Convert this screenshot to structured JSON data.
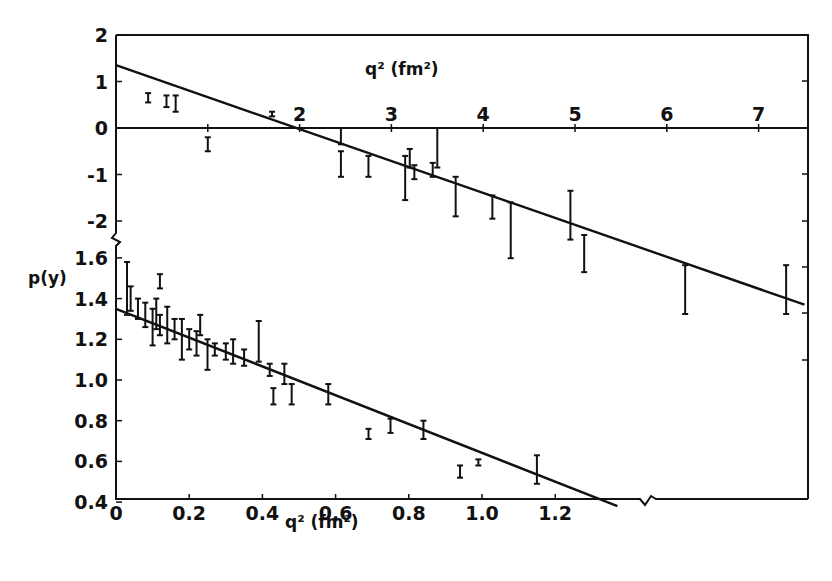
{
  "chart_data": [
    {
      "panel": "upper",
      "type": "scatter",
      "title": "",
      "xlabel": "q² (fm²)",
      "xlabel_position": "top-inside",
      "ylabel": "",
      "xlim": [
        0,
        7.55
      ],
      "ylim": [
        -2.5,
        2
      ],
      "x_ticks": [
        "1",
        "2",
        "3",
        "4",
        "5",
        "6",
        "7"
      ],
      "x_tick_values": [
        1,
        2,
        3,
        4,
        5,
        6,
        7
      ],
      "y_ticks": [
        "2",
        "1",
        "0",
        "-1",
        "-2"
      ],
      "y_tick_values": [
        2,
        1,
        0,
        -1,
        -2
      ],
      "zero_line": true,
      "grid": false,
      "fit_line": {
        "x": [
          0,
          7.5
        ],
        "y": [
          1.35,
          -3.8
        ]
      },
      "points": [
        {
          "x": 0.35,
          "lo": 0.55,
          "hi": 0.75
        },
        {
          "x": 0.55,
          "lo": 0.45,
          "hi": 0.7
        },
        {
          "x": 0.65,
          "lo": 0.35,
          "hi": 0.7
        },
        {
          "x": 1.0,
          "lo": -0.5,
          "hi": -0.2
        },
        {
          "x": 1.7,
          "lo": 0.25,
          "hi": 0.35
        },
        {
          "x": 2.45,
          "lo": -0.35,
          "hi": 0.0
        },
        {
          "x": 2.45,
          "lo": -1.05,
          "hi": -0.5
        },
        {
          "x": 2.75,
          "lo": -1.05,
          "hi": -0.6
        },
        {
          "x": 3.15,
          "lo": -1.55,
          "hi": -0.6
        },
        {
          "x": 3.2,
          "lo": -0.85,
          "hi": -0.45
        },
        {
          "x": 3.25,
          "lo": -1.1,
          "hi": -0.8
        },
        {
          "x": 3.45,
          "lo": -1.05,
          "hi": -0.75
        },
        {
          "x": 3.5,
          "lo": -0.85,
          "hi": 0.0
        },
        {
          "x": 3.7,
          "lo": -1.9,
          "hi": -1.05
        },
        {
          "x": 4.1,
          "lo": -1.95,
          "hi": -1.45
        },
        {
          "x": 4.3,
          "lo": -2.8,
          "hi": -1.6
        },
        {
          "x": 4.95,
          "lo": -2.4,
          "hi": -1.35
        },
        {
          "x": 5.1,
          "lo": -3.1,
          "hi": -2.3
        },
        {
          "x": 6.2,
          "lo": -4.0,
          "hi": -2.95
        },
        {
          "x": 7.3,
          "lo": -4.0,
          "hi": -2.95
        }
      ]
    },
    {
      "panel": "lower",
      "type": "scatter",
      "title": "",
      "xlabel": "q² (fm²)",
      "ylabel": "p(y)",
      "xlim": [
        0,
        1.85
      ],
      "ylim": [
        0.32,
        1.65
      ],
      "x_ticks": [
        "0",
        "0.2",
        "0.4",
        "0.6",
        "0.8",
        "1.0",
        "1.2"
      ],
      "x_tick_values": [
        0,
        0.2,
        0.4,
        0.6,
        0.8,
        1.0,
        1.2
      ],
      "y_ticks": [
        "1.6",
        "1.4",
        "1.2",
        "1.0",
        "0.8",
        "0.6",
        "0.4"
      ],
      "y_tick_values": [
        1.6,
        1.4,
        1.2,
        1.0,
        0.8,
        0.6,
        0.4
      ],
      "axis_break": true,
      "grid": false,
      "fit_line": {
        "x": [
          0,
          1.37
        ],
        "y": [
          1.35,
          0.38
        ]
      },
      "points": [
        {
          "x": 0.03,
          "lo": 1.32,
          "hi": 1.58
        },
        {
          "x": 0.04,
          "lo": 1.34,
          "hi": 1.46
        },
        {
          "x": 0.06,
          "lo": 1.3,
          "hi": 1.4
        },
        {
          "x": 0.08,
          "lo": 1.26,
          "hi": 1.38
        },
        {
          "x": 0.1,
          "lo": 1.17,
          "hi": 1.35
        },
        {
          "x": 0.11,
          "lo": 1.25,
          "hi": 1.4
        },
        {
          "x": 0.12,
          "lo": 1.22,
          "hi": 1.32
        },
        {
          "x": 0.12,
          "lo": 1.45,
          "hi": 1.52
        },
        {
          "x": 0.14,
          "lo": 1.18,
          "hi": 1.36
        },
        {
          "x": 0.16,
          "lo": 1.2,
          "hi": 1.3
        },
        {
          "x": 0.18,
          "lo": 1.1,
          "hi": 1.3
        },
        {
          "x": 0.2,
          "lo": 1.15,
          "hi": 1.25
        },
        {
          "x": 0.22,
          "lo": 1.12,
          "hi": 1.24
        },
        {
          "x": 0.23,
          "lo": 1.22,
          "hi": 1.32
        },
        {
          "x": 0.25,
          "lo": 1.05,
          "hi": 1.2
        },
        {
          "x": 0.27,
          "lo": 1.12,
          "hi": 1.18
        },
        {
          "x": 0.3,
          "lo": 1.1,
          "hi": 1.18
        },
        {
          "x": 0.32,
          "lo": 1.08,
          "hi": 1.2
        },
        {
          "x": 0.35,
          "lo": 1.07,
          "hi": 1.15
        },
        {
          "x": 0.39,
          "lo": 1.09,
          "hi": 1.29
        },
        {
          "x": 0.42,
          "lo": 1.02,
          "hi": 1.08
        },
        {
          "x": 0.43,
          "lo": 0.88,
          "hi": 0.96
        },
        {
          "x": 0.46,
          "lo": 0.98,
          "hi": 1.08
        },
        {
          "x": 0.48,
          "lo": 0.88,
          "hi": 0.98
        },
        {
          "x": 0.58,
          "lo": 0.88,
          "hi": 0.98
        },
        {
          "x": 0.69,
          "lo": 0.71,
          "hi": 0.76
        },
        {
          "x": 0.75,
          "lo": 0.74,
          "hi": 0.81
        },
        {
          "x": 0.84,
          "lo": 0.71,
          "hi": 0.8
        },
        {
          "x": 0.94,
          "lo": 0.52,
          "hi": 0.58
        },
        {
          "x": 0.99,
          "lo": 0.58,
          "hi": 0.61
        },
        {
          "x": 1.15,
          "lo": 0.49,
          "hi": 0.63
        }
      ]
    }
  ],
  "axes": {
    "upper_x_label": "q² (fm²)",
    "lower_x_label": "q² (fm²)",
    "lower_y_label": "p(y)"
  }
}
